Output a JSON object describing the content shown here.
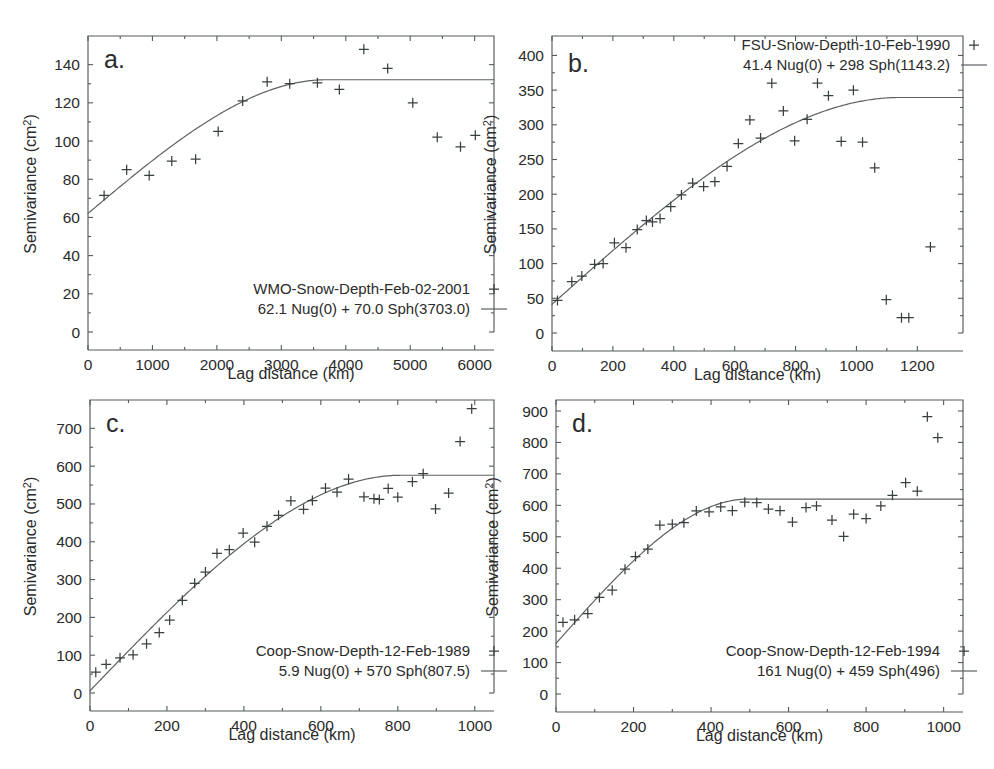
{
  "figure": {
    "background": "#ffffff",
    "marker_color": "#3a3f41",
    "curve_color": "#5c6163",
    "axis_color": "#555a5c",
    "width": 994,
    "height": 769,
    "clipped_top_text": ""
  },
  "chart_data": [
    {
      "id": "panel-a",
      "type": "scatter",
      "panel_label": "a.",
      "title": "",
      "xlabel": "Lag distance (km)",
      "ylabel": "Semivariance (cm2)",
      "ylabel_display": "Semivariance (cm",
      "ylabel_superscript": "2",
      "ylabel_tail": ")",
      "xlim": [
        0,
        6300
      ],
      "ylim": [
        0,
        155
      ],
      "xticks": [
        0,
        1000,
        2000,
        3000,
        4000,
        5000,
        6000
      ],
      "xticklabels": [
        "0",
        "1000",
        "2000",
        "3000",
        "4000",
        "5000",
        "6000"
      ],
      "yticks": [
        0,
        20,
        40,
        60,
        80,
        100,
        120,
        140
      ],
      "yticklabels": [
        "0",
        "20",
        "40",
        "60",
        "80",
        "100",
        "120",
        "140"
      ],
      "grid": false,
      "legend_position": "lower-right",
      "legend": [
        {
          "label": "WMO-Snow-Depth-Feb-02-2001",
          "marker": "plus"
        },
        {
          "label": "62.1 Nug(0) + 70.0 Sph(3703.0)",
          "marker": "line"
        }
      ],
      "model": {
        "nugget": 62.1,
        "sill_partial": 70.0,
        "range": 3703.0
      },
      "points": [
        {
          "x": 250,
          "y": 71.5
        },
        {
          "x": 600,
          "y": 85.0
        },
        {
          "x": 950,
          "y": 82.0
        },
        {
          "x": 1300,
          "y": 89.5
        },
        {
          "x": 1670,
          "y": 90.5
        },
        {
          "x": 2020,
          "y": 105.0
        },
        {
          "x": 2400,
          "y": 121.0
        },
        {
          "x": 2780,
          "y": 131.0
        },
        {
          "x": 3130,
          "y": 130.0
        },
        {
          "x": 3560,
          "y": 130.5
        },
        {
          "x": 3900,
          "y": 127.0
        },
        {
          "x": 4280,
          "y": 148.0
        },
        {
          "x": 4650,
          "y": 138.0
        },
        {
          "x": 5040,
          "y": 120.0
        },
        {
          "x": 5420,
          "y": 102.0
        },
        {
          "x": 5780,
          "y": 97.0
        },
        {
          "x": 6010,
          "y": 103.0
        }
      ]
    },
    {
      "id": "panel-b",
      "type": "scatter",
      "panel_label": "b.",
      "title": "",
      "xlabel": "Lag distance (km)",
      "ylabel": "Semivariance (cm2)",
      "ylabel_display": "Semivariance (cm",
      "ylabel_superscript": "2",
      "ylabel_tail": ")",
      "xlim": [
        0,
        1350
      ],
      "ylim": [
        0,
        428
      ],
      "xticks": [
        0,
        200,
        400,
        600,
        800,
        1000,
        1200
      ],
      "xticklabels": [
        "0",
        "200",
        "400",
        "600",
        "800",
        "1000",
        "1200"
      ],
      "yticks": [
        0,
        50,
        100,
        150,
        200,
        250,
        300,
        350,
        400
      ],
      "yticklabels": [
        "0",
        "50",
        "100",
        "150",
        "200",
        "250",
        "300",
        "350",
        "400"
      ],
      "grid": false,
      "legend_position": "upper-right",
      "legend": [
        {
          "label": "FSU-Snow-Depth-10-Feb-1990",
          "marker": "plus"
        },
        {
          "label": "41.4 Nug(0) + 298 Sph(1143.2)",
          "marker": "line"
        }
      ],
      "model": {
        "nugget": 41.4,
        "sill_partial": 298,
        "range": 1143.2
      },
      "points": [
        {
          "x": 18,
          "y": 47
        },
        {
          "x": 65,
          "y": 74
        },
        {
          "x": 98,
          "y": 82
        },
        {
          "x": 140,
          "y": 99
        },
        {
          "x": 168,
          "y": 100
        },
        {
          "x": 205,
          "y": 130
        },
        {
          "x": 243,
          "y": 123
        },
        {
          "x": 280,
          "y": 149
        },
        {
          "x": 310,
          "y": 162
        },
        {
          "x": 330,
          "y": 160
        },
        {
          "x": 355,
          "y": 165
        },
        {
          "x": 390,
          "y": 182
        },
        {
          "x": 425,
          "y": 199
        },
        {
          "x": 462,
          "y": 216
        },
        {
          "x": 498,
          "y": 211
        },
        {
          "x": 535,
          "y": 218
        },
        {
          "x": 575,
          "y": 240
        },
        {
          "x": 612,
          "y": 273
        },
        {
          "x": 650,
          "y": 307
        },
        {
          "x": 685,
          "y": 281
        },
        {
          "x": 722,
          "y": 360
        },
        {
          "x": 760,
          "y": 320
        },
        {
          "x": 797,
          "y": 277
        },
        {
          "x": 838,
          "y": 308
        },
        {
          "x": 872,
          "y": 360
        },
        {
          "x": 908,
          "y": 342
        },
        {
          "x": 950,
          "y": 276
        },
        {
          "x": 990,
          "y": 350
        },
        {
          "x": 1020,
          "y": 275
        },
        {
          "x": 1060,
          "y": 238
        },
        {
          "x": 1098,
          "y": 48
        },
        {
          "x": 1148,
          "y": 22
        },
        {
          "x": 1172,
          "y": 22
        },
        {
          "x": 1243,
          "y": 124
        }
      ]
    },
    {
      "id": "panel-c",
      "type": "scatter",
      "panel_label": "c.",
      "title": "",
      "xlabel": "Lag distance (km)",
      "ylabel": "Semivariance (cm2)",
      "ylabel_display": "Semivariance (cm",
      "ylabel_superscript": "2",
      "ylabel_tail": ")",
      "xlim": [
        0,
        1050
      ],
      "ylim": [
        0,
        775
      ],
      "xticks": [
        0,
        200,
        400,
        600,
        800,
        1000
      ],
      "xticklabels": [
        "0",
        "200",
        "400",
        "600",
        "800",
        "1000"
      ],
      "yticks": [
        0,
        100,
        200,
        300,
        400,
        500,
        600,
        700
      ],
      "yticklabels": [
        "0",
        "100",
        "200",
        "300",
        "400",
        "500",
        "600",
        "700"
      ],
      "grid": false,
      "legend_position": "lower-right",
      "legend": [
        {
          "label": "Coop-Snow-Depth-12-Feb-1989",
          "marker": "plus"
        },
        {
          "label": "5.9 Nug(0) + 570 Sph(807.5)",
          "marker": "line"
        }
      ],
      "model": {
        "nugget": 5.9,
        "sill_partial": 570,
        "range": 807.5
      },
      "points": [
        {
          "x": 15,
          "y": 55
        },
        {
          "x": 42,
          "y": 76
        },
        {
          "x": 78,
          "y": 93
        },
        {
          "x": 112,
          "y": 101
        },
        {
          "x": 147,
          "y": 130
        },
        {
          "x": 180,
          "y": 160
        },
        {
          "x": 207,
          "y": 193
        },
        {
          "x": 240,
          "y": 245
        },
        {
          "x": 272,
          "y": 290
        },
        {
          "x": 300,
          "y": 320
        },
        {
          "x": 330,
          "y": 369
        },
        {
          "x": 362,
          "y": 379
        },
        {
          "x": 398,
          "y": 423
        },
        {
          "x": 428,
          "y": 399
        },
        {
          "x": 460,
          "y": 441
        },
        {
          "x": 490,
          "y": 470
        },
        {
          "x": 522,
          "y": 508
        },
        {
          "x": 555,
          "y": 486
        },
        {
          "x": 578,
          "y": 509
        },
        {
          "x": 612,
          "y": 542
        },
        {
          "x": 642,
          "y": 531
        },
        {
          "x": 672,
          "y": 566
        },
        {
          "x": 712,
          "y": 519
        },
        {
          "x": 738,
          "y": 514
        },
        {
          "x": 752,
          "y": 512
        },
        {
          "x": 775,
          "y": 541
        },
        {
          "x": 800,
          "y": 518
        },
        {
          "x": 838,
          "y": 559
        },
        {
          "x": 866,
          "y": 580
        },
        {
          "x": 898,
          "y": 487
        },
        {
          "x": 932,
          "y": 529
        },
        {
          "x": 962,
          "y": 665
        },
        {
          "x": 992,
          "y": 752
        }
      ]
    },
    {
      "id": "panel-d",
      "type": "scatter",
      "panel_label": "d.",
      "title": "",
      "xlabel": "Lag distance (km)",
      "ylabel": "Semivariance (cm2)",
      "ylabel_display": "Semivariance (cm",
      "ylabel_superscript": "2",
      "ylabel_tail": ")",
      "xlim": [
        0,
        1050
      ],
      "ylim": [
        0,
        935
      ],
      "xticks": [
        0,
        200,
        400,
        600,
        800,
        1000
      ],
      "xticklabels": [
        "0",
        "200",
        "400",
        "600",
        "800",
        "1000"
      ],
      "yticks": [
        0,
        100,
        200,
        300,
        400,
        500,
        600,
        700,
        800,
        900
      ],
      "yticklabels": [
        "0",
        "100",
        "200",
        "300",
        "400",
        "500",
        "600",
        "700",
        "800",
        "900"
      ],
      "grid": false,
      "legend_position": "lower-right",
      "legend": [
        {
          "label": "Coop-Snow-Depth-12-Feb-1994",
          "marker": "plus"
        },
        {
          "label": "161 Nug(0) + 459 Sph(496)",
          "marker": "line"
        }
      ],
      "model": {
        "nugget": 161,
        "sill_partial": 459,
        "range": 496
      },
      "points": [
        {
          "x": 18,
          "y": 228
        },
        {
          "x": 48,
          "y": 236
        },
        {
          "x": 82,
          "y": 256
        },
        {
          "x": 112,
          "y": 307
        },
        {
          "x": 145,
          "y": 330
        },
        {
          "x": 178,
          "y": 397
        },
        {
          "x": 205,
          "y": 437
        },
        {
          "x": 237,
          "y": 461
        },
        {
          "x": 268,
          "y": 537
        },
        {
          "x": 300,
          "y": 540
        },
        {
          "x": 330,
          "y": 545
        },
        {
          "x": 362,
          "y": 582
        },
        {
          "x": 395,
          "y": 579
        },
        {
          "x": 425,
          "y": 595
        },
        {
          "x": 455,
          "y": 583
        },
        {
          "x": 487,
          "y": 610
        },
        {
          "x": 518,
          "y": 609
        },
        {
          "x": 548,
          "y": 588
        },
        {
          "x": 578,
          "y": 583
        },
        {
          "x": 610,
          "y": 547
        },
        {
          "x": 645,
          "y": 593
        },
        {
          "x": 672,
          "y": 598
        },
        {
          "x": 712,
          "y": 553
        },
        {
          "x": 742,
          "y": 501
        },
        {
          "x": 768,
          "y": 572
        },
        {
          "x": 800,
          "y": 558
        },
        {
          "x": 838,
          "y": 598
        },
        {
          "x": 868,
          "y": 632
        },
        {
          "x": 902,
          "y": 672
        },
        {
          "x": 932,
          "y": 645
        },
        {
          "x": 958,
          "y": 882
        },
        {
          "x": 985,
          "y": 815
        }
      ]
    }
  ]
}
